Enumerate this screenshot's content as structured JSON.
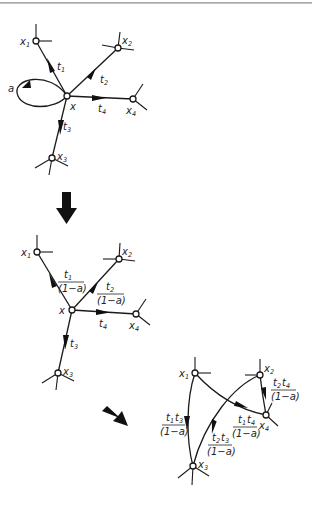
{
  "figure": {
    "colors": {
      "ink": "#1a1a1a",
      "background": "#ffffff"
    },
    "stage1": {
      "nodes": {
        "x1": "x",
        "x1_sub": "1",
        "x2": "x",
        "x2_sub": "2",
        "x3": "x",
        "x3_sub": "3",
        "x4": "x",
        "x4_sub": "4",
        "x": "x"
      },
      "self_loop": "a",
      "edges": {
        "t1": "t",
        "t1_sub": "1",
        "t2": "t",
        "t2_sub": "2",
        "t3": "t",
        "t3_sub": "3",
        "t4": "t",
        "t4_sub": "4"
      }
    },
    "stage2": {
      "nodes": {
        "x1": "x",
        "x1_sub": "1",
        "x2": "x",
        "x2_sub": "2",
        "x3": "x",
        "x3_sub": "3",
        "x4": "x",
        "x4_sub": "4",
        "x": "x"
      },
      "edges": {
        "t1_num": "t",
        "t1_num_sub": "1",
        "t1_den": "(1−a)",
        "t2_num": "t",
        "t2_num_sub": "2",
        "t2_den": "(1−a)",
        "t3": "t",
        "t3_sub": "3",
        "t4": "t",
        "t4_sub": "4"
      }
    },
    "stage3": {
      "nodes": {
        "x1": "x",
        "x1_sub": "1",
        "x2": "x",
        "x2_sub": "2",
        "x3": "x",
        "x3_sub": "3",
        "x4": "x",
        "x4_sub": "4"
      },
      "edges": {
        "t1t3_a": "t",
        "t1t3_a_sub": "1",
        "t1t3_b": "t",
        "t1t3_b_sub": "3",
        "t1t3_den": "(1−a)",
        "t1t4_a": "t",
        "t1t4_a_sub": "1",
        "t1t4_b": "t",
        "t1t4_b_sub": "4",
        "t1t4_den": "(1−a)",
        "t2t3_a": "t",
        "t2t3_a_sub": "2",
        "t2t3_b": "t",
        "t2t3_b_sub": "3",
        "t2t3_den": "(1−a)",
        "t2t4_a": "t",
        "t2t4_a_sub": "2",
        "t2t4_b": "t",
        "t2t4_b_sub": "4",
        "t2t4_den": "(1−a)"
      }
    },
    "transitions": [
      "down-arrow",
      "diagonal-arrow"
    ]
  }
}
